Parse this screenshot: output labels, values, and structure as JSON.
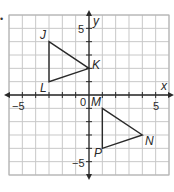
{
  "bullet": "•",
  "plane": {
    "x_range": [
      -6,
      6
    ],
    "y_range": [
      -6,
      6
    ],
    "axis_labels": {
      "x": "x",
      "y": "y"
    },
    "tick_labels": {
      "x_neg": "−5",
      "x_pos": "5",
      "y_pos": "5",
      "y_neg": "−5",
      "origin": "0"
    },
    "grid_color": "#c8c8c8",
    "border_color": "#b0b0b0",
    "axis_color": "#2a2a2a"
  },
  "chart_data": {
    "type": "scatter",
    "title": "",
    "xlabel": "x",
    "ylabel": "y",
    "xlim": [
      -6,
      6
    ],
    "ylim": [
      -6,
      6
    ],
    "grid": true,
    "series": [
      {
        "name": "Triangle JKL",
        "points": [
          {
            "label": "J",
            "x": -3,
            "y": 4
          },
          {
            "label": "K",
            "x": 0,
            "y": 2
          },
          {
            "label": "L",
            "x": -3,
            "y": 1
          }
        ]
      },
      {
        "name": "Triangle MNP",
        "points": [
          {
            "label": "M",
            "x": 1,
            "y": -1
          },
          {
            "label": "N",
            "x": 4,
            "y": -3
          },
          {
            "label": "P",
            "x": 1,
            "y": -4
          }
        ]
      }
    ]
  },
  "vertices": {
    "J": "J",
    "K": "K",
    "L": "L",
    "M": "M",
    "N": "N",
    "P": "P"
  }
}
